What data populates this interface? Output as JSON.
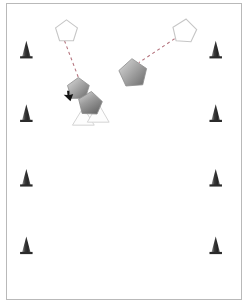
{
  "app": {
    "title": "Multi-Agent Navigation Simulation",
    "view": "top-down-2d"
  },
  "canvas": {
    "width": 236,
    "height": 297,
    "background_color": "#ffffff",
    "border_color": "#b9b9b9",
    "origin_x": 6,
    "origin_y": 3
  },
  "scene": {
    "obstacles_label": "cone-markers",
    "agents_label": "pentagon-agents",
    "goals_label": "goal-outlines",
    "markers_label": "triangle-markers"
  },
  "colors": {
    "obstacle_dark": "#2f2f2f",
    "obstacle_light": "#8a8a8a",
    "agent_light": "#d2d2d2",
    "agent_dark": "#6b6b6b",
    "agent_stroke": "#8e8e8e",
    "goal_stroke": "#c9c9c9",
    "goal_fill": "#ffffff",
    "path_dash": "#b0707a",
    "triangle_stroke": "#cfcfcf",
    "triangle_fill": "#fdfdfd",
    "cursor_fill": "#1a1a1a"
  },
  "obstacles": [
    {
      "id": "cone-left-1",
      "x": 15,
      "y": 37,
      "w": 9,
      "h": 17
    },
    {
      "id": "cone-left-2",
      "x": 15,
      "y": 101,
      "w": 9,
      "h": 17
    },
    {
      "id": "cone-left-3",
      "x": 15,
      "y": 166,
      "w": 9,
      "h": 17
    },
    {
      "id": "cone-left-4",
      "x": 15,
      "y": 234,
      "w": 9,
      "h": 17
    },
    {
      "id": "cone-right-1",
      "x": 215,
      "y": 37,
      "w": 9,
      "h": 17
    },
    {
      "id": "cone-right-2",
      "x": 215,
      "y": 101,
      "w": 9,
      "h": 17
    },
    {
      "id": "cone-right-3",
      "x": 215,
      "y": 166,
      "w": 9,
      "h": 17
    },
    {
      "id": "cone-right-4",
      "x": 215,
      "y": 234,
      "w": 9,
      "h": 17
    }
  ],
  "agents": [
    {
      "id": "agent-1",
      "x": 72,
      "y": 85,
      "radius": 11,
      "rotation": -8
    },
    {
      "id": "agent-2",
      "x": 83,
      "y": 101,
      "radius": 12,
      "rotation": 14
    },
    {
      "id": "agent-3",
      "x": 127,
      "y": 69,
      "radius": 14,
      "rotation": -6
    }
  ],
  "goals": [
    {
      "id": "goal-1",
      "x": 60,
      "y": 27,
      "radius": 11,
      "rotation": 4
    },
    {
      "id": "goal-2",
      "x": 180,
      "y": 29,
      "radius": 12,
      "rotation": 16
    }
  ],
  "paths": [
    {
      "id": "path-1",
      "from_x": 60,
      "from_y": 38,
      "to_x": 74,
      "to_y": 75,
      "dash": "3,3"
    },
    {
      "id": "path-2",
      "from_x": 170,
      "from_y": 36,
      "to_x": 134,
      "to_y": 60,
      "dash": "3,3"
    }
  ],
  "triangles": [
    {
      "id": "triangle-1",
      "x": 77,
      "y": 118,
      "w": 21,
      "h": 18
    },
    {
      "id": "triangle-2",
      "x": 91,
      "y": 115,
      "w": 21,
      "h": 18
    }
  ],
  "cursor": {
    "id": "mouse-cursor",
    "x": 70,
    "y": 103,
    "rotation": 200
  }
}
